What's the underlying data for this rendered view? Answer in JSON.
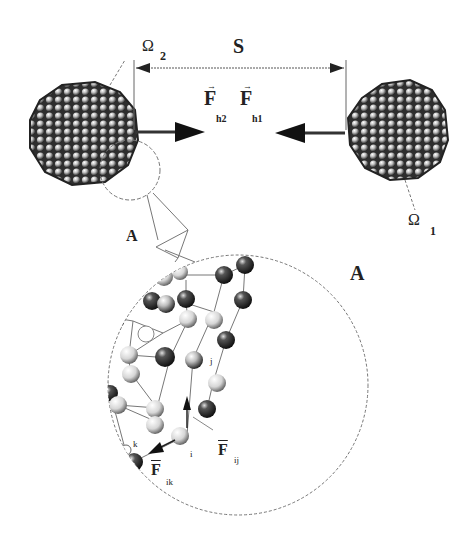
{
  "diagram": {
    "type": "nanoparticle-interaction-schematic",
    "labels": {
      "omega2": "Ω",
      "omega2_sub": "2",
      "omega1": "Ω",
      "omega1_sub": "1",
      "separation": "S",
      "force_h2": "F",
      "force_h2_sub": "h2",
      "force_h1": "F",
      "force_h1_sub": "h1",
      "detail_marker": "A",
      "detail_title": "A",
      "atom_j": "j",
      "atom_i": "i",
      "atom_k": "k",
      "force_ij": "F",
      "force_ij_sub": "ij",
      "force_ik": "F",
      "force_ik_sub": "ik"
    },
    "nodes": [
      {
        "id": "cluster-omega2",
        "label": "Ω2",
        "shape": "sphere-cluster",
        "cx": 80,
        "cy": 125,
        "r": 52
      },
      {
        "id": "cluster-omega1",
        "label": "Ω1",
        "shape": "sphere-cluster",
        "cx": 400,
        "cy": 125,
        "r": 50
      },
      {
        "id": "detail-circle-A",
        "label": "A",
        "shape": "circle",
        "cx": 238,
        "cy": 385,
        "r": 130
      },
      {
        "id": "marker-circle-A",
        "label": "A",
        "shape": "circle",
        "cx": 130,
        "cy": 170,
        "r": 30
      }
    ],
    "edges": [
      {
        "from": "cluster-omega2",
        "to": "cluster-omega1",
        "label": "S",
        "type": "dimension"
      },
      {
        "from": "cluster-omega2",
        "to": "center",
        "label": "F h2",
        "type": "force-arrow"
      },
      {
        "from": "cluster-omega1",
        "to": "center",
        "label": "F h1",
        "type": "force-arrow"
      },
      {
        "from": "atom-i",
        "to": "atom-j",
        "label": "F ij",
        "type": "force-arrow"
      },
      {
        "from": "atom-i",
        "to": "atom-k",
        "label": "F ik",
        "type": "force-arrow"
      },
      {
        "from": "marker-circle-A",
        "to": "detail-circle-A",
        "type": "zoom-callout"
      }
    ],
    "colors": {
      "ink": "#222222",
      "sphere_dark": "#3a3a3a",
      "sphere_light": "#e8e8e8",
      "line": "#777777"
    }
  }
}
